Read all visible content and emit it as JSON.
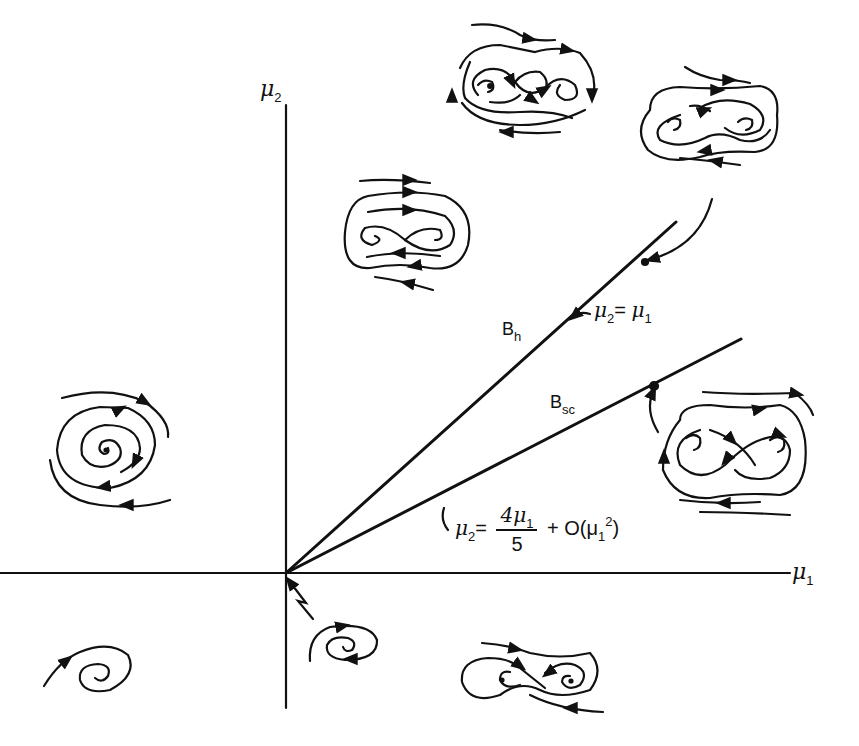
{
  "diagram": {
    "axes": {
      "x_label": "μ",
      "x_sub": "1",
      "y_label": "μ",
      "y_sub": "2"
    },
    "curves": {
      "bh": {
        "label": "B",
        "label_sub": "h",
        "equation": {
          "lhs": "μ",
          "lhs_sub": "2",
          "eq": "=",
          "rhs": "μ",
          "rhs_sub": "1"
        }
      },
      "bsc": {
        "label": "B",
        "label_sub": "sc",
        "equation": {
          "lhs": "μ",
          "lhs_sub": "2",
          "eq": "=",
          "num": "4μ",
          "num_sub": "1",
          "den": "5",
          "plus": "+ O(μ",
          "o_sub": "1",
          "o_sup": "2",
          "close": ")"
        }
      }
    },
    "phase_portraits": [
      {
        "region": "mu1<0, mu2>0",
        "description": "stable focus, trajectories spiral inward"
      },
      {
        "region": "mu1<0, mu2<0",
        "description": "spiral focus"
      },
      {
        "region": "origin inset, mu2<0",
        "description": "small spiral with limit cycle"
      },
      {
        "region": "mu1>0, mu2<0",
        "description": "saddle with two foci, figure-eight"
      },
      {
        "region": "between mu2-axis and Bh",
        "description": "saddle with two foci and outer cycle"
      },
      {
        "region": "above Bh (top)",
        "description": "figure-eight with two unstable foci"
      },
      {
        "region": "on Bh",
        "description": "homoclinic loops, pointer to point on Bh"
      },
      {
        "region": "on Bsc",
        "description": "saddle connection, pointer to point on Bsc"
      }
    ],
    "colors": {
      "ink": "#111111",
      "background": "#ffffff"
    }
  }
}
